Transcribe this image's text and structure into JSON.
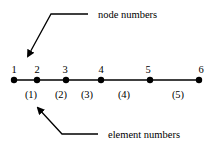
{
  "diagram": {
    "annotations": {
      "node_label": "node numbers",
      "element_label": "element numbers"
    },
    "nodes": [
      {
        "label": "1",
        "x": 14
      },
      {
        "label": "2",
        "x": 37
      },
      {
        "label": "3",
        "x": 66
      },
      {
        "label": "4",
        "x": 101
      },
      {
        "label": "5",
        "x": 150
      },
      {
        "label": "6",
        "x": 199
      }
    ],
    "elements": [
      {
        "label": "(1)",
        "x": 31
      },
      {
        "label": "(2)",
        "x": 62
      },
      {
        "label": "(3)",
        "x": 89
      },
      {
        "label": "(4)",
        "x": 125
      },
      {
        "label": "(5)",
        "x": 179
      }
    ],
    "colors": {
      "stroke": "#000000",
      "background": "#ffffff"
    }
  }
}
